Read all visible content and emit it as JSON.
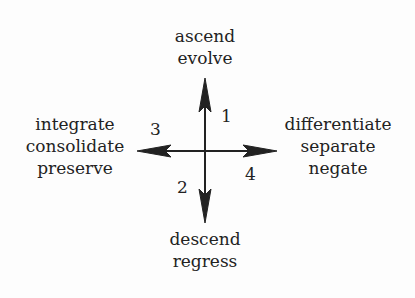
{
  "diagram": {
    "type": "four-direction-arrows",
    "colors": {
      "ink": "#222222",
      "background": "#fdfdfd"
    },
    "directions": {
      "up": {
        "number": "1",
        "lines": [
          "ascend",
          "evolve"
        ]
      },
      "down": {
        "number": "2",
        "lines": [
          "descend",
          "regress"
        ]
      },
      "left": {
        "number": "3",
        "lines": [
          "integrate",
          "consolidate",
          "preserve"
        ]
      },
      "right": {
        "number": "4",
        "lines": [
          "differentiate",
          "separate",
          "negate"
        ]
      }
    }
  }
}
